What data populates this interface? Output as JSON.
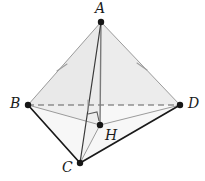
{
  "figure": {
    "kind": "geometry-diagram",
    "canvas": {
      "width": 205,
      "height": 181
    },
    "colors": {
      "solid_edge": "#1a1a1a",
      "light_edge": "#8d8d8d",
      "hidden_edge": "#6f6f6f",
      "face_fill": "#ececec",
      "under_fill": "#f4f4f4",
      "vertex_dot": "#161616",
      "tick_mark": "#9a9a9a",
      "label_text": "#1b1b1b",
      "background": "#ffffff"
    },
    "vertices": [
      {
        "name": "A",
        "label": "A",
        "x": 101,
        "y": 22,
        "label_x": 95,
        "label_y": 2,
        "dot_r": 3.1
      },
      {
        "name": "B",
        "label": "B",
        "x": 28,
        "y": 105,
        "label_x": 11,
        "label_y": 96,
        "dot_r": 3.1
      },
      {
        "name": "D",
        "label": "D",
        "x": 180,
        "y": 105,
        "label_x": 188,
        "label_y": 96,
        "dot_r": 3.1
      },
      {
        "name": "C",
        "label": "C",
        "x": 80,
        "y": 163,
        "label_x": 63,
        "label_y": 160,
        "dot_r": 3.1
      },
      {
        "name": "H",
        "label": "H",
        "x": 100,
        "y": 125,
        "label_x": 105,
        "label_y": 128,
        "dot_r": 3.1
      }
    ],
    "edges": [
      {
        "name": "edge-AB",
        "from": "A",
        "to": "B",
        "style": "light",
        "width": 1.0
      },
      {
        "name": "edge-AD",
        "from": "A",
        "to": "D",
        "style": "light",
        "width": 1.0
      },
      {
        "name": "edge-AC",
        "from": "A",
        "to": "C",
        "style": "solid",
        "width": 1.2
      },
      {
        "name": "edge-AH",
        "from": "A",
        "to": "H",
        "style": "medium",
        "width": 1.3
      },
      {
        "name": "edge-BD",
        "from": "B",
        "to": "D",
        "style": "dashed",
        "width": 1.1
      },
      {
        "name": "edge-BC",
        "from": "B",
        "to": "C",
        "style": "solid",
        "width": 1.6
      },
      {
        "name": "edge-CD",
        "from": "C",
        "to": "D",
        "style": "solid",
        "width": 1.6
      },
      {
        "name": "edge-BH",
        "from": "B",
        "to": "H",
        "style": "light",
        "width": 1.0
      },
      {
        "name": "edge-DH",
        "from": "D",
        "to": "H",
        "style": "light",
        "width": 1.0
      },
      {
        "name": "edge-CH",
        "from": "C",
        "to": "H",
        "style": "light",
        "width": 1.0
      }
    ],
    "faces": [
      {
        "name": "face-ABD",
        "points": "101,22 28,105 180,105",
        "fill": "#ececec"
      },
      {
        "name": "face-BCD-upper",
        "points": "28,105 80,163 180,105",
        "fill": "#f6f6f6"
      }
    ],
    "tick_marks": [
      {
        "name": "tick-AB",
        "x": 62,
        "y": 68,
        "angle": 48
      },
      {
        "name": "tick-AD",
        "x": 142,
        "y": 66,
        "angle": -48
      },
      {
        "name": "tick-BD",
        "x": 88,
        "y": 105,
        "angle": 0
      }
    ],
    "right_angle": {
      "name": "right-angle-AHB",
      "points": "89,115 98,113 100,122",
      "stroke": "#5d5d5d"
    }
  }
}
